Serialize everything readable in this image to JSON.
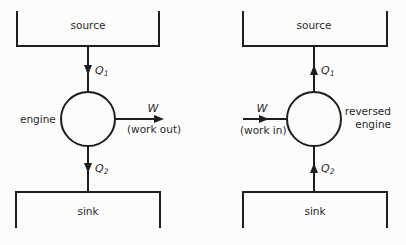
{
  "diagram": {
    "left": {
      "title": "heat engine",
      "source_label": "source",
      "sink_label": "sink",
      "engine_label": "engine",
      "q1_symbol": "Q",
      "q1_subscript": "1",
      "q2_symbol": "Q",
      "q2_subscript": "2",
      "work_symbol": "W",
      "work_caption": "(work out)",
      "q1_direction": "down",
      "q2_direction": "down",
      "work_direction": "out"
    },
    "right": {
      "title": "reversed engine",
      "source_label": "source",
      "sink_label": "sink",
      "engine_label_line1": "reversed",
      "engine_label_line2": "engine",
      "q1_symbol": "Q",
      "q1_subscript": "1",
      "q2_symbol": "Q",
      "q2_subscript": "2",
      "work_symbol": "W",
      "work_caption": "(work in)",
      "q1_direction": "up",
      "q2_direction": "up",
      "work_direction": "in"
    }
  }
}
